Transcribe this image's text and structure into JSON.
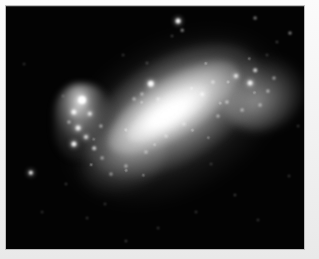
{
  "figure": {
    "kind": "astronomical-photograph",
    "caption": "",
    "plate": {
      "sky_color": "#030303",
      "mount_color": "#f0f0f0",
      "border_color": "#bdbdbd",
      "left": 6,
      "top": 6,
      "width": 298,
      "height": 243
    }
  },
  "chart_data": {
    "type": "scatter",
    "title": "",
    "subtitle": "",
    "xlabel": "",
    "ylabel": "",
    "grid": false,
    "legend": null,
    "axis_ranges": {
      "x": [
        0,
        298
      ],
      "y": [
        0,
        243
      ]
    },
    "structures": [
      {
        "name": "halo",
        "cx": 168,
        "cy": 105,
        "rx": 116,
        "ry": 75,
        "angle_deg": -30,
        "peak_intensity": 0.42
      },
      {
        "name": "disc",
        "cx": 168,
        "cy": 104,
        "rx": 96,
        "ry": 52,
        "angle_deg": -31,
        "peak_intensity": 0.78
      },
      {
        "name": "bar",
        "cx": 167,
        "cy": 101,
        "rx": 75,
        "ry": 29,
        "angle_deg": -32,
        "peak_intensity": 0.96
      },
      {
        "name": "nucleus",
        "cx": 162,
        "cy": 108,
        "rx": 46,
        "ry": 16,
        "angle_deg": -32,
        "peak_intensity": 1.0
      },
      {
        "name": "ne-wing",
        "cx": 256,
        "cy": 88,
        "rx": 42,
        "ry": 36,
        "angle_deg": -22,
        "peak_intensity": 0.6
      },
      {
        "name": "sw-tail",
        "cx": 117,
        "cy": 153,
        "rx": 45,
        "ry": 33,
        "angle_deg": -28,
        "peak_intensity": 0.52
      },
      {
        "name": "hii-complex-west",
        "cx": 78,
        "cy": 116,
        "rx": 30,
        "ry": 38,
        "angle_deg": 0,
        "peak_intensity": 0.88
      }
    ],
    "bright_knots": [
      {
        "x": 76,
        "y": 94,
        "r": 4.0,
        "intensity": 1.0
      },
      {
        "x": 68,
        "y": 106,
        "r": 2.6,
        "intensity": 0.88
      },
      {
        "x": 84,
        "y": 108,
        "r": 2.2,
        "intensity": 0.8
      },
      {
        "x": 72,
        "y": 122,
        "r": 2.4,
        "intensity": 0.86
      },
      {
        "x": 80,
        "y": 131,
        "r": 2.0,
        "intensity": 0.78
      },
      {
        "x": 68,
        "y": 138,
        "r": 2.6,
        "intensity": 0.9
      },
      {
        "x": 88,
        "y": 142,
        "r": 1.8,
        "intensity": 0.7
      },
      {
        "x": 95,
        "y": 120,
        "r": 1.6,
        "intensity": 0.66
      },
      {
        "x": 63,
        "y": 116,
        "r": 1.5,
        "intensity": 0.62
      },
      {
        "x": 145,
        "y": 78,
        "r": 3.2,
        "intensity": 0.95
      },
      {
        "x": 136,
        "y": 88,
        "r": 1.6,
        "intensity": 0.62
      },
      {
        "x": 128,
        "y": 93,
        "r": 1.4,
        "intensity": 0.58
      },
      {
        "x": 152,
        "y": 93,
        "r": 1.4,
        "intensity": 0.56
      },
      {
        "x": 196,
        "y": 88,
        "r": 1.8,
        "intensity": 0.72
      },
      {
        "x": 207,
        "y": 76,
        "r": 1.6,
        "intensity": 0.68
      },
      {
        "x": 230,
        "y": 70,
        "r": 2.0,
        "intensity": 0.8
      },
      {
        "x": 244,
        "y": 77,
        "r": 2.4,
        "intensity": 0.88
      },
      {
        "x": 249,
        "y": 64,
        "r": 1.8,
        "intensity": 0.74
      },
      {
        "x": 262,
        "y": 85,
        "r": 1.6,
        "intensity": 0.66
      },
      {
        "x": 268,
        "y": 72,
        "r": 1.5,
        "intensity": 0.62
      },
      {
        "x": 221,
        "y": 96,
        "r": 1.6,
        "intensity": 0.7
      },
      {
        "x": 212,
        "y": 110,
        "r": 1.5,
        "intensity": 0.62
      },
      {
        "x": 236,
        "y": 104,
        "r": 1.4,
        "intensity": 0.58
      },
      {
        "x": 254,
        "y": 99,
        "r": 1.4,
        "intensity": 0.56
      },
      {
        "x": 178,
        "y": 118,
        "r": 1.5,
        "intensity": 0.6
      },
      {
        "x": 160,
        "y": 130,
        "r": 1.5,
        "intensity": 0.6
      },
      {
        "x": 140,
        "y": 146,
        "r": 1.5,
        "intensity": 0.58
      },
      {
        "x": 120,
        "y": 160,
        "r": 1.6,
        "intensity": 0.62
      },
      {
        "x": 105,
        "y": 168,
        "r": 1.5,
        "intensity": 0.58
      },
      {
        "x": 96,
        "y": 152,
        "r": 1.4,
        "intensity": 0.56
      }
    ],
    "field_stars": [
      {
        "x": 172,
        "y": 15,
        "r": 2.4,
        "intensity": 0.92
      },
      {
        "x": 176,
        "y": 24,
        "r": 1.3,
        "intensity": 0.56
      },
      {
        "x": 166,
        "y": 30,
        "r": 1.0,
        "intensity": 0.4
      },
      {
        "x": 249,
        "y": 12,
        "r": 1.4,
        "intensity": 0.52
      },
      {
        "x": 284,
        "y": 27,
        "r": 1.5,
        "intensity": 0.58
      },
      {
        "x": 271,
        "y": 36,
        "r": 1.1,
        "intensity": 0.42
      },
      {
        "x": 261,
        "y": 49,
        "r": 1.0,
        "intensity": 0.36
      },
      {
        "x": 141,
        "y": 57,
        "r": 1.1,
        "intensity": 0.44
      },
      {
        "x": 117,
        "y": 49,
        "r": 0.9,
        "intensity": 0.32
      },
      {
        "x": 57,
        "y": 90,
        "r": 1.0,
        "intensity": 0.38
      },
      {
        "x": 25,
        "y": 167,
        "r": 2.2,
        "intensity": 0.88
      },
      {
        "x": 60,
        "y": 178,
        "r": 1.0,
        "intensity": 0.36
      },
      {
        "x": 99,
        "y": 198,
        "r": 1.0,
        "intensity": 0.34
      },
      {
        "x": 81,
        "y": 212,
        "r": 0.9,
        "intensity": 0.3
      },
      {
        "x": 120,
        "y": 235,
        "r": 1.1,
        "intensity": 0.4
      },
      {
        "x": 152,
        "y": 222,
        "r": 0.9,
        "intensity": 0.3
      },
      {
        "x": 190,
        "y": 206,
        "r": 1.0,
        "intensity": 0.34
      },
      {
        "x": 229,
        "y": 189,
        "r": 1.1,
        "intensity": 0.4
      },
      {
        "x": 252,
        "y": 214,
        "r": 1.0,
        "intensity": 0.34
      },
      {
        "x": 283,
        "y": 170,
        "r": 1.0,
        "intensity": 0.34
      },
      {
        "x": 292,
        "y": 120,
        "r": 0.9,
        "intensity": 0.3
      },
      {
        "x": 18,
        "y": 58,
        "r": 0.9,
        "intensity": 0.28
      },
      {
        "x": 36,
        "y": 206,
        "r": 0.9,
        "intensity": 0.28
      },
      {
        "x": 205,
        "y": 158,
        "r": 0.9,
        "intensity": 0.3
      }
    ]
  }
}
